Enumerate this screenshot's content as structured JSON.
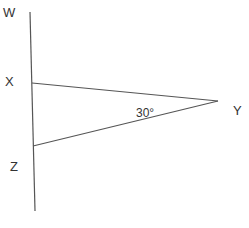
{
  "diagram": {
    "type": "geometry",
    "points": {
      "W": {
        "label": "W",
        "x": 31,
        "y": 12
      },
      "X": {
        "label": "X",
        "x": 32,
        "y": 83
      },
      "Y": {
        "label": "Y",
        "x": 218,
        "y": 101
      },
      "Z": {
        "label": "Z",
        "x": 33,
        "y": 146
      },
      "bottom": {
        "x": 35,
        "y": 211
      }
    },
    "segments": [
      {
        "from": "W",
        "to": "bottom",
        "name": "line-WZ"
      },
      {
        "from": "X",
        "to": "Y",
        "name": "segment-XY"
      },
      {
        "from": "Z",
        "to": "Y",
        "name": "segment-ZY"
      }
    ],
    "angle_label": "30°",
    "colors": {
      "line": "#555555",
      "text": "#333333",
      "background": "#ffffff"
    }
  }
}
